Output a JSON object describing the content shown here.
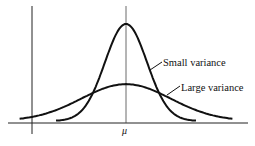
{
  "chart_data": {
    "type": "line",
    "title": "",
    "xlabel": "",
    "ylabel": "",
    "x_tick_labels": [
      "μ"
    ],
    "mean_label": "μ",
    "xlim": [
      -4,
      4
    ],
    "grid": false,
    "series": [
      {
        "name": "Small variance",
        "mean": 0,
        "sd": 0.75,
        "relative_peak": 1.0
      },
      {
        "name": "Large variance",
        "mean": 0,
        "sd": 1.6,
        "relative_peak": 0.38
      }
    ],
    "annotations": [
      {
        "text": "Small variance",
        "points_to": "Small variance"
      },
      {
        "text": "Large variance",
        "points_to": "Large variance"
      }
    ]
  }
}
